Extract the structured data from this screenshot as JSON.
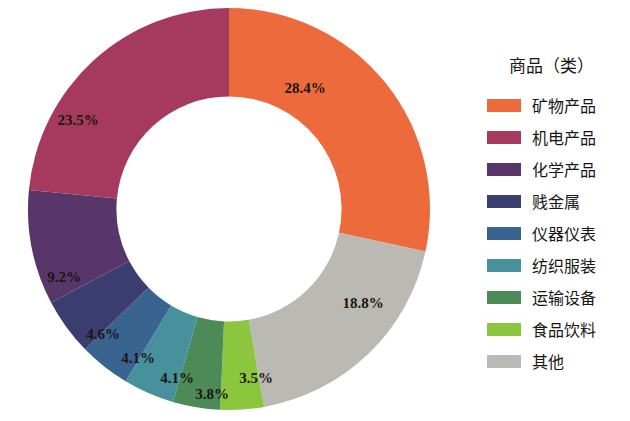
{
  "legend": {
    "title": "商品（类）",
    "items": [
      {
        "label": "矿物产品",
        "color": "#ED6A3C"
      },
      {
        "label": "机电产品",
        "color": "#A63A5E"
      },
      {
        "label": "化学产品",
        "color": "#58366A"
      },
      {
        "label": "贱金属",
        "color": "#3B3C70"
      },
      {
        "label": "仪器仪表",
        "color": "#3A6490"
      },
      {
        "label": "纺织服装",
        "color": "#47919D"
      },
      {
        "label": "运输设备",
        "color": "#4C8B58"
      },
      {
        "label": "食品饮料",
        "color": "#8CC63E"
      },
      {
        "label": "其他",
        "color": "#BBB9B4"
      }
    ]
  },
  "chart_data": {
    "type": "pie",
    "title": "",
    "subtitle": "",
    "xlabel": "",
    "ylabel": "",
    "legend_position": "right",
    "donut": true,
    "inner_radius_ratio": 0.56,
    "start_angle_deg": 0,
    "direction": "clockwise",
    "categories": [
      "矿物产品",
      "其他",
      "食品饮料",
      "运输设备",
      "纺织服装",
      "仪器仪表",
      "贱金属",
      "化学产品",
      "机电产品"
    ],
    "values": [
      28.4,
      18.8,
      3.5,
      3.8,
      4.1,
      4.1,
      4.6,
      9.2,
      23.5
    ],
    "colors": [
      "#ED6A3C",
      "#BBB9B4",
      "#8CC63E",
      "#4C8B58",
      "#47919D",
      "#3A6490",
      "#3B3C70",
      "#58366A",
      "#A63A5E"
    ],
    "labels": [
      "28.4%",
      "18.8%",
      "3.5%",
      "3.8%",
      "4.1%",
      "4.1%",
      "4.6%",
      "9.2%",
      "23.5%"
    ],
    "slices": [
      {
        "name": "矿物产品",
        "value": 28.4,
        "label": "28.4%",
        "color": "#ED6A3C",
        "label_x": 305,
        "label_y": 88
      },
      {
        "name": "其他",
        "value": 18.8,
        "label": "18.8%",
        "color": "#BBB9B4",
        "label_x": 363,
        "label_y": 303
      },
      {
        "name": "食品饮料",
        "value": 3.5,
        "label": "3.5%",
        "color": "#8CC63E",
        "label_x": 256,
        "label_y": 378
      },
      {
        "name": "运输设备",
        "value": 3.8,
        "label": "3.8%",
        "color": "#4C8B58",
        "label_x": 212,
        "label_y": 394
      },
      {
        "name": "纺织服装",
        "value": 4.1,
        "label": "4.1%",
        "color": "#47919D",
        "label_x": 177,
        "label_y": 378
      },
      {
        "name": "仪器仪表",
        "value": 4.1,
        "label": "4.1%",
        "color": "#3A6490",
        "label_x": 138,
        "label_y": 358
      },
      {
        "name": "贱金属",
        "value": 4.6,
        "label": "4.6%",
        "color": "#3B3C70",
        "label_x": 103,
        "label_y": 334
      },
      {
        "name": "化学产品",
        "value": 9.2,
        "label": "9.2%",
        "color": "#58366A",
        "label_x": 64,
        "label_y": 277
      },
      {
        "name": "机电产品",
        "value": 23.5,
        "label": "23.5%",
        "color": "#A63A5E",
        "label_x": 78,
        "label_y": 120
      }
    ]
  }
}
